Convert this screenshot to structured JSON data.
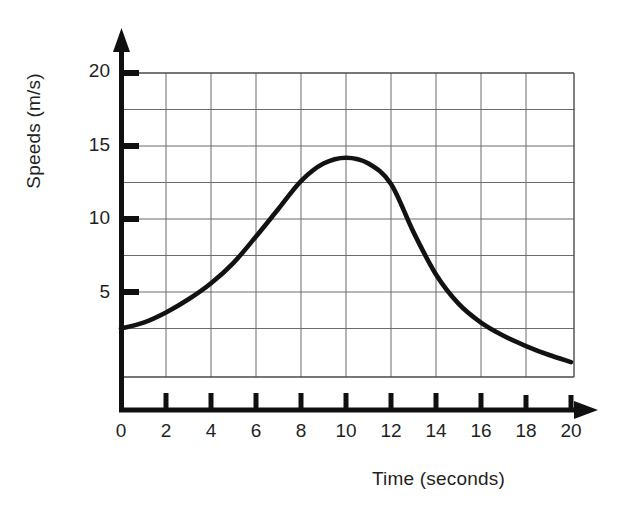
{
  "chart_data": {
    "type": "line",
    "title": "",
    "subtitle": "",
    "xlabel": "Time (seconds)",
    "ylabel": "Speeds (m/s)",
    "xlim": [
      0,
      20
    ],
    "ylim": [
      0,
      20
    ],
    "x_ticks": [
      0,
      2,
      4,
      6,
      8,
      10,
      12,
      14,
      16,
      18,
      20
    ],
    "x_tick_labels": [
      "0",
      "2",
      "4",
      "6",
      "8",
      "10",
      "12",
      "14",
      "16",
      "18",
      "20"
    ],
    "y_ticks": [
      5,
      10,
      15,
      20
    ],
    "y_tick_labels": [
      "5",
      "10",
      "15",
      "20"
    ],
    "grid": true,
    "grid_x_step": 2,
    "grid_y_step": 2.5,
    "grid_y_min": 2.5,
    "grid_y_max": 20,
    "legend": null,
    "legend_position": "none",
    "axis_arrows": true,
    "series": [
      {
        "name": "Speed",
        "color": "#121212",
        "x": [
          0,
          1,
          2,
          3,
          4,
          5,
          6,
          7,
          8,
          9,
          10,
          11,
          12,
          13,
          14,
          15,
          16,
          17,
          18,
          19,
          20
        ],
        "values": [
          2.5,
          2.9,
          3.6,
          4.5,
          5.6,
          7.0,
          8.8,
          10.7,
          12.6,
          13.8,
          14.2,
          13.8,
          12.4,
          9.1,
          6.2,
          4.2,
          2.9,
          2.0,
          1.3,
          0.7,
          0.2
        ]
      }
    ],
    "annotations": [
      {
        "label": "peak",
        "x": 10,
        "y": 14.2
      }
    ]
  },
  "axes": {
    "x_title": "Time (seconds)",
    "y_title": "Speeds (m/s)"
  }
}
